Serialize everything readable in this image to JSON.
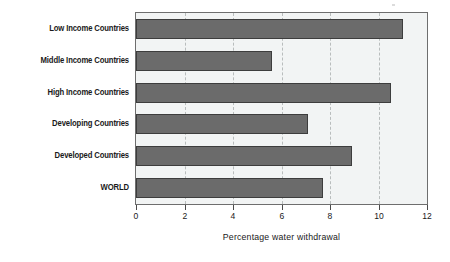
{
  "chart_data": {
    "type": "bar",
    "orientation": "horizontal",
    "title": "",
    "subtitle": "",
    "xlabel": "Percentage water withdrawal",
    "ylabel": "",
    "categories": [
      "Low Income Countries",
      "Middle Income Countries",
      "High Income Countries",
      "Developing Countries",
      "Developed Countries",
      "WORLD"
    ],
    "values": [
      11.0,
      5.6,
      10.5,
      7.1,
      8.9,
      7.7
    ],
    "xlim": [
      0,
      12
    ],
    "xticks": [
      0,
      2,
      4,
      6,
      8,
      10,
      12
    ],
    "xticklabels": [
      "0",
      "2",
      "4",
      "6",
      "8",
      "10",
      "12"
    ],
    "grid": "vertical-dashed",
    "legend": "none",
    "colors": {
      "bar_fill": "#6b6b6b",
      "bar_edge": "#3d3d3d",
      "plot_background": "#f2f4f4",
      "frame": "#6e6e6e",
      "gridline": "#b9bdbd",
      "text": "#1a1a1a",
      "page_background": "#ffffff"
    }
  }
}
